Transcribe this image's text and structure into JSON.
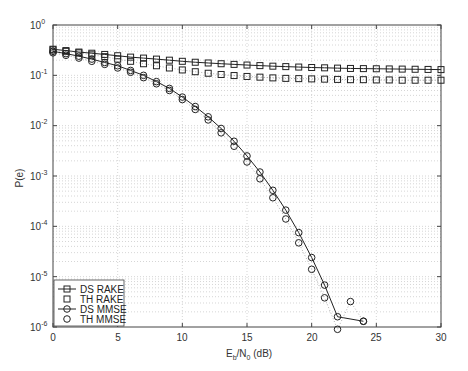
{
  "chart_data": {
    "type": "line",
    "title": "",
    "xlabel": "E_b/N_0 (dB)",
    "ylabel": "P(e)",
    "xscale": "linear",
    "yscale": "log",
    "xlim": [
      0,
      30
    ],
    "ylim": [
      1e-06,
      1
    ],
    "xticks": [
      0,
      5,
      10,
      15,
      20,
      25,
      30
    ],
    "yticks": [
      "10^0",
      "10^-1",
      "10^-2",
      "10^-3",
      "10^-4",
      "10^-5",
      "10^-6"
    ],
    "grid": true,
    "legend_position": "lower left",
    "series": [
      {
        "name": "DS RAKE",
        "style": "solid-square",
        "x": [
          0,
          1,
          2,
          3,
          4,
          5,
          6,
          7,
          8,
          9,
          10,
          11,
          12,
          13,
          14,
          15,
          16,
          17,
          18,
          19,
          20,
          21,
          22,
          23,
          24,
          25,
          26,
          27,
          28,
          29,
          30
        ],
        "values": [
          0.33,
          0.31,
          0.29,
          0.275,
          0.26,
          0.245,
          0.23,
          0.22,
          0.21,
          0.2,
          0.19,
          0.182,
          0.176,
          0.17,
          0.165,
          0.16,
          0.156,
          0.152,
          0.149,
          0.146,
          0.143,
          0.141,
          0.139,
          0.137,
          0.136,
          0.135,
          0.134,
          0.133,
          0.132,
          0.131,
          0.13
        ]
      },
      {
        "name": "TH RAKE",
        "style": "dotted-square",
        "x": [
          0,
          1,
          2,
          3,
          4,
          5,
          6,
          7,
          8,
          9,
          10,
          11,
          12,
          13,
          14,
          15,
          16,
          17,
          18,
          19,
          20,
          21,
          22,
          23,
          24,
          25,
          26,
          27,
          28,
          29,
          30
        ],
        "values": [
          0.32,
          0.3,
          0.28,
          0.255,
          0.235,
          0.21,
          0.19,
          0.17,
          0.155,
          0.14,
          0.128,
          0.118,
          0.11,
          0.104,
          0.099,
          0.095,
          0.092,
          0.089,
          0.087,
          0.086,
          0.085,
          0.084,
          0.083,
          0.082,
          0.082,
          0.081,
          0.081,
          0.08,
          0.08,
          0.08,
          0.08
        ]
      },
      {
        "name": "DS MMSE",
        "style": "solid-circle",
        "x": [
          0,
          1,
          2,
          3,
          4,
          5,
          6,
          7,
          8,
          9,
          10,
          11,
          12,
          13,
          14,
          15,
          16,
          17,
          18,
          19,
          20,
          21,
          22,
          23,
          24
        ],
        "values": [
          0.3,
          0.27,
          0.24,
          0.21,
          0.18,
          0.155,
          0.125,
          0.1,
          0.075,
          0.055,
          0.037,
          0.024,
          0.015,
          0.0088,
          0.0049,
          0.0025,
          0.0012,
          0.00052,
          0.00021,
          7.5e-05,
          2.4e-05,
          6.8e-06,
          1.6e-06,
          3.5e-07,
          1.3e-06
        ]
      },
      {
        "name": "TH MMSE",
        "style": "dotted-circle",
        "x": [
          0,
          1,
          2,
          3,
          4,
          5,
          6,
          7,
          8,
          9,
          10,
          11,
          12,
          13,
          14,
          15,
          16,
          17,
          18,
          19,
          20,
          21,
          22,
          23,
          24
        ],
        "values": [
          0.28,
          0.25,
          0.22,
          0.19,
          0.165,
          0.14,
          0.115,
          0.09,
          0.068,
          0.05,
          0.033,
          0.021,
          0.013,
          0.0072,
          0.0039,
          0.0019,
          0.00088,
          0.00037,
          0.00014,
          4.7e-05,
          1.4e-05,
          3.8e-06,
          9e-07,
          3.2e-06,
          1.3e-06
        ]
      }
    ]
  },
  "axes": {
    "xtick_labels": [
      "0",
      "5",
      "10",
      "15",
      "20",
      "25",
      "30"
    ],
    "ytick_bases": [
      "10",
      "10",
      "10",
      "10",
      "10",
      "10",
      "10"
    ],
    "ytick_exps": [
      "0",
      "-1",
      "-2",
      "-3",
      "-4",
      "-5",
      "-6"
    ],
    "ylabel": "P(e)",
    "xlabel_E": "E",
    "xlabel_b": "b",
    "xlabel_N": "/N",
    "xlabel_0": "0",
    "xlabel_rest": " (dB)"
  },
  "legend": {
    "items": [
      "DS RAKE",
      "TH RAKE",
      "DS MMSE",
      "TH MMSE"
    ]
  }
}
